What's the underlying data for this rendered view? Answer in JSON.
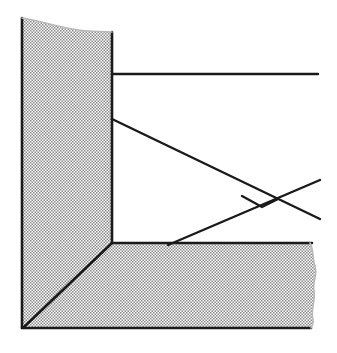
{
  "document": {
    "title": "Hatched Section Corner Detail",
    "kind": "line-drawing",
    "width": 337,
    "height": 353,
    "background_color": "#ffffff"
  },
  "style": {
    "line_color": "#1a1a1a",
    "hatch_color": "#8a8a8a",
    "hatch_background": "#ffffff",
    "outline_width": 2.6,
    "thin_line_width": 2.4,
    "hatch_cell_px": 3
  },
  "geometry": {
    "wall": {
      "name": "vertical-hatched-wall",
      "description": "Hatched vertical member on the left with a torn top edge",
      "left_x": 22,
      "right_x": 112,
      "top_left_y": 18,
      "top_right_y": 32,
      "bottom_y": 243
    },
    "floor": {
      "name": "horizontal-hatched-floor",
      "description": "Hatched horizontal member along the bottom with a torn right edge",
      "top_y": 243,
      "bottom_y": 328,
      "left_x": 22,
      "right_x": 316
    },
    "miter": {
      "name": "miter-joint-line",
      "from": [
        112,
        243
      ],
      "to": [
        24,
        327
      ]
    },
    "upper_horizontal_line": {
      "name": "upper-horizontal-reference-line",
      "from": [
        112,
        74
      ],
      "to": [
        318,
        74
      ]
    },
    "descending_diagonal": {
      "name": "descending-diagonal-line",
      "from": [
        112,
        119
      ],
      "to": [
        320,
        219
      ]
    },
    "ascending_diagonal": {
      "name": "ascending-diagonal-line",
      "from": [
        168,
        245
      ],
      "to": [
        320,
        180
      ]
    },
    "valley_vertex": {
      "name": "valley-vertex-point",
      "at": [
        262,
        207
      ]
    },
    "crossing_point": {
      "name": "line-crossing-point",
      "at": [
        242,
        196
      ]
    },
    "outline_polygon_points": "22,18 112,32 112,243 316,243 316,328 22,328"
  },
  "labels": {
    "wall": "",
    "floor": "",
    "upper_line": "",
    "diagonal": ""
  }
}
